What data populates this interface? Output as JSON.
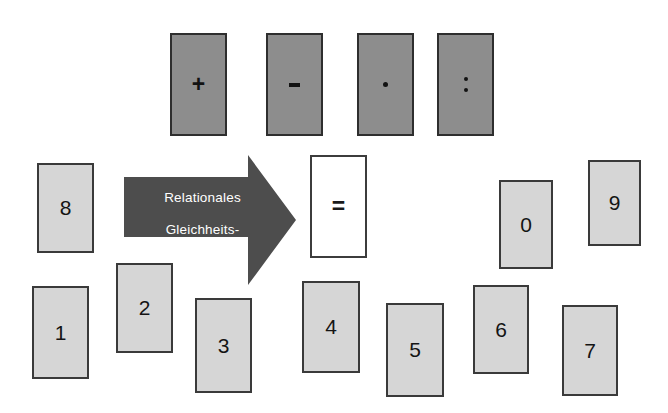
{
  "figure": {
    "colors": {
      "digit_card_fill": "#d6d6d6",
      "operator_card_fill": "#8d8d8d",
      "equals_card_fill": "#ffffff",
      "card_border": "#3a3a3a",
      "arrow_fill": "#4d4d4d",
      "arrow_text": "#ffffff",
      "background": "#ffffff"
    }
  },
  "arrow": {
    "label": "Relationales\nGleichheits-\nverständnis",
    "line1": "Relationales",
    "line2": "Gleichheits-",
    "line3": "verständnis",
    "direction": "right"
  },
  "operator_cards": [
    {
      "id": "op-plus",
      "label": "+",
      "glyph": "plus-icon",
      "x": 170,
      "y": 33,
      "w": 57,
      "h": 103
    },
    {
      "id": "op-minus",
      "label": "-",
      "glyph": "minus-icon",
      "x": 266,
      "y": 33,
      "w": 57,
      "h": 103
    },
    {
      "id": "op-times",
      "label": "·",
      "glyph": "multiply-icon",
      "x": 357,
      "y": 33,
      "w": 57,
      "h": 103
    },
    {
      "id": "op-div",
      "label": ":",
      "glyph": "divide-icon",
      "x": 437,
      "y": 33,
      "w": 57,
      "h": 103
    }
  ],
  "equals_card": {
    "id": "eq",
    "label": "=",
    "x": 310,
    "y": 155,
    "w": 57,
    "h": 103
  },
  "number_cards": [
    {
      "id": "num-8",
      "label": "8",
      "x": 37,
      "y": 163,
      "w": 57,
      "h": 90
    },
    {
      "id": "num-1",
      "label": "1",
      "x": 32,
      "y": 286,
      "w": 57,
      "h": 93
    },
    {
      "id": "num-2",
      "label": "2",
      "x": 116,
      "y": 263,
      "w": 57,
      "h": 90
    },
    {
      "id": "num-3",
      "label": "3",
      "x": 195,
      "y": 298,
      "w": 57,
      "h": 95
    },
    {
      "id": "num-4",
      "label": "4",
      "x": 302,
      "y": 281,
      "w": 58,
      "h": 92
    },
    {
      "id": "num-5",
      "label": "5",
      "x": 386,
      "y": 303,
      "w": 58,
      "h": 94
    },
    {
      "id": "num-6",
      "label": "6",
      "x": 473,
      "y": 285,
      "w": 56,
      "h": 89
    },
    {
      "id": "num-7",
      "label": "7",
      "x": 562,
      "y": 305,
      "w": 56,
      "h": 91
    },
    {
      "id": "num-0",
      "label": "0",
      "x": 499,
      "y": 180,
      "w": 54,
      "h": 89
    },
    {
      "id": "num-9",
      "label": "9",
      "x": 588,
      "y": 160,
      "w": 53,
      "h": 86
    }
  ]
}
